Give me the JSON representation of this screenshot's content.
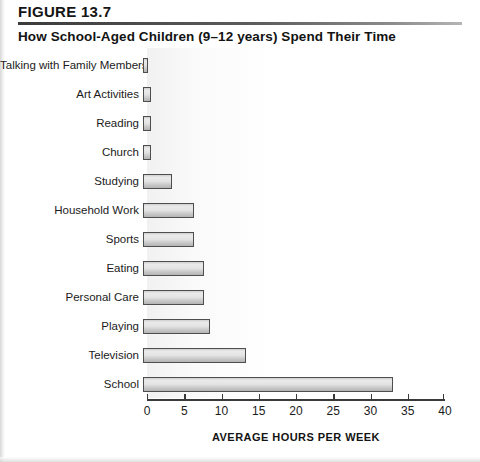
{
  "figure": {
    "number_label": "FIGURE 13.7",
    "title": "How School-Aged Children (9–12 years) Spend Their Time"
  },
  "chart_data": {
    "type": "bar",
    "orientation": "horizontal",
    "title": "How School-Aged Children (9–12 years) Spend Their Time",
    "xlabel": "AVERAGE HOURS PER WEEK",
    "ylabel": "",
    "xlim": [
      0,
      40
    ],
    "xticks": [
      0,
      5,
      10,
      15,
      20,
      25,
      30,
      35,
      40
    ],
    "xtick_labels": [
      "0",
      "5",
      "10",
      "15",
      "20",
      "25",
      "30",
      "35",
      "40"
    ],
    "grid": false,
    "legend": null,
    "categories": [
      "Talking with Family Members",
      "Art Activities",
      "Reading",
      "Church",
      "Studying",
      "Household Work",
      "Sports",
      "Eating",
      "Personal Care",
      "Playing",
      "Television",
      "School"
    ],
    "values": [
      0.7,
      1.1,
      1.1,
      1.1,
      3.9,
      6.8,
      6.8,
      8.2,
      8.2,
      9.0,
      13.8,
      33.5
    ],
    "bar_fill": "#dcdcdc",
    "bar_border": "#4e4e4e"
  }
}
